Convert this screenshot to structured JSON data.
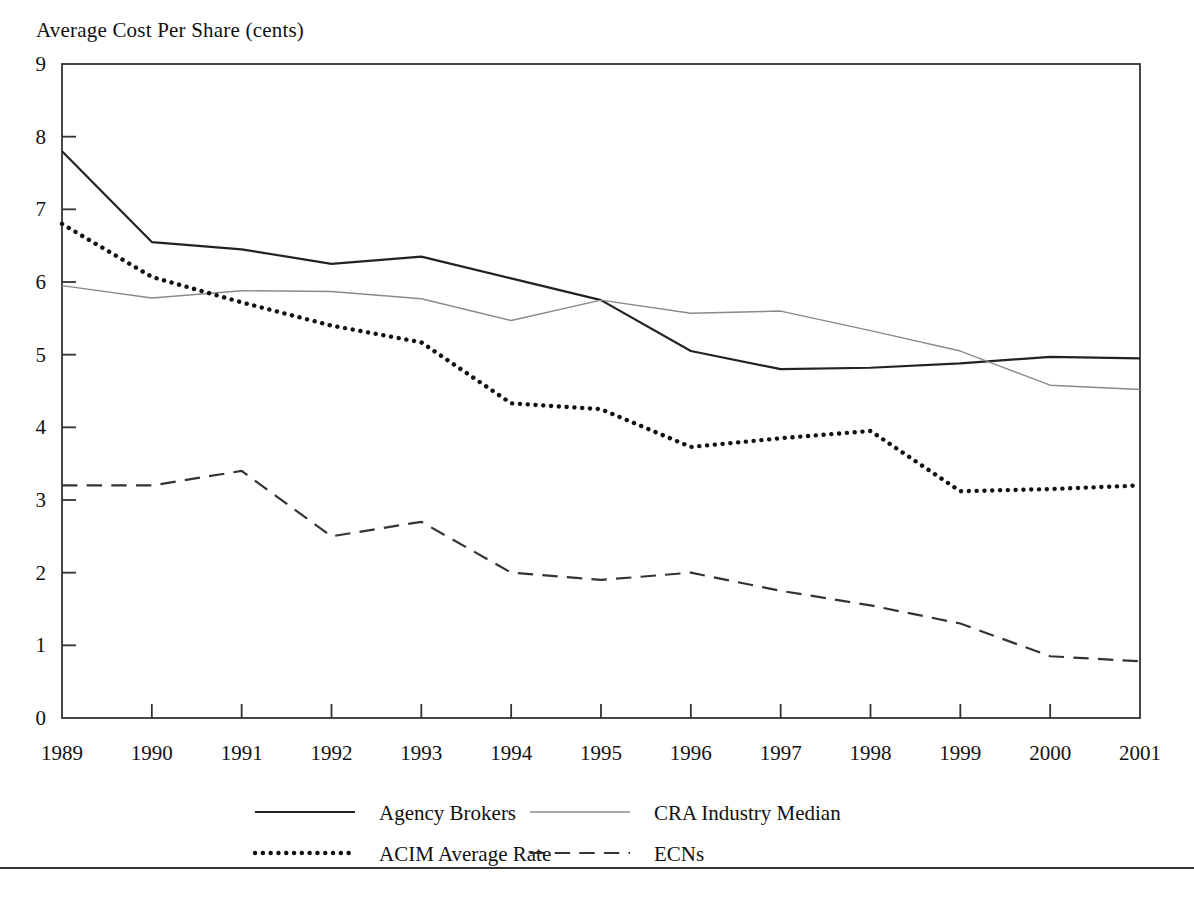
{
  "figure": {
    "title": "Average Cost Per Share (cents)",
    "footer_rule": true
  },
  "chart_data": {
    "type": "line",
    "title": "Average Cost Per Share (cents)",
    "xlabel": "",
    "ylabel": "Average Cost Per Share (cents)",
    "x": [
      1989,
      1990,
      1991,
      1992,
      1993,
      1994,
      1995,
      1996,
      1997,
      1998,
      1999,
      2000,
      2001
    ],
    "categories": [
      "1989",
      "1990",
      "1991",
      "1992",
      "1993",
      "1994",
      "1995",
      "1996",
      "1997",
      "1998",
      "1999",
      "2000",
      "2001"
    ],
    "xlim": [
      1989,
      2001
    ],
    "ylim": [
      0,
      9
    ],
    "yticks": [
      0,
      1,
      2,
      3,
      4,
      5,
      6,
      7,
      8,
      9
    ],
    "ytick_labels": [
      "0",
      "1",
      "2",
      "3",
      "4",
      "5",
      "6",
      "7",
      "8",
      "9"
    ],
    "grid": false,
    "legend_position": "below-axes",
    "series": [
      {
        "name": "Agency Brokers",
        "style": "solid",
        "color": "#222222",
        "width": 2.2,
        "values": [
          7.8,
          6.55,
          6.45,
          6.25,
          6.35,
          6.05,
          5.75,
          5.05,
          4.8,
          4.82,
          4.88,
          4.97,
          4.95
        ]
      },
      {
        "name": "CRA Industry Median",
        "style": "solid",
        "color": "#8a8a8a",
        "width": 1.4,
        "values": [
          5.95,
          5.78,
          5.88,
          5.87,
          5.77,
          5.47,
          5.75,
          5.57,
          5.6,
          5.33,
          5.05,
          4.58,
          4.52
        ]
      },
      {
        "name": "ACIM Average Rate",
        "style": "dotted",
        "color": "#111111",
        "width": 4.4,
        "values": [
          6.8,
          6.07,
          5.72,
          5.4,
          5.17,
          4.33,
          4.25,
          3.73,
          3.85,
          3.95,
          3.12,
          3.15,
          3.2
        ]
      },
      {
        "name": "ECNs",
        "style": "dashed",
        "color": "#333333",
        "width": 2.2,
        "values": [
          3.2,
          3.2,
          3.4,
          2.5,
          2.7,
          2.0,
          1.9,
          2.0,
          1.75,
          1.55,
          1.3,
          0.85,
          0.78
        ]
      }
    ],
    "legend": [
      {
        "label": "Agency Brokers",
        "style": "solid",
        "color": "#222222",
        "width": 2.2
      },
      {
        "label": "CRA Industry Median",
        "style": "solid",
        "color": "#8a8a8a",
        "width": 1.4
      },
      {
        "label": "ACIM Average Rate",
        "style": "dotted",
        "color": "#111111",
        "width": 4.4
      },
      {
        "label": "ECNs",
        "style": "dashed",
        "color": "#333333",
        "width": 2.2
      }
    ]
  }
}
